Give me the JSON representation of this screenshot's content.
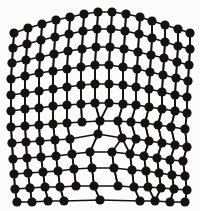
{
  "figure": {
    "name": "edge-dislocation-lattice",
    "title": "Edge dislocation in a crystal lattice",
    "background_color": "#fcfcfb",
    "atom_color": "#151210",
    "bond_color": "#141210",
    "atom_radius": 4.6,
    "bond_width": 1.7,
    "width": 200,
    "height": 211
  },
  "chart_data": {
    "type": "scatter",
    "title": "Edge dislocation in a crystal lattice",
    "xlabel": "",
    "ylabel": "",
    "grid": false,
    "legend": null,
    "xlim": [
      0,
      200
    ],
    "ylim": [
      0,
      211
    ],
    "annotations": [
      "extra half-plane terminating at dislocation core",
      "lattice rows curve around core",
      "bottom row shows gap where planes merge"
    ],
    "rows": [
      {
        "row": 0,
        "atoms": [
          [
            14,
            33
          ],
          [
            28,
            28
          ],
          [
            42,
            24
          ],
          [
            56,
            20
          ],
          [
            70,
            17
          ],
          [
            84,
            14
          ],
          [
            98,
            12
          ],
          [
            112,
            12
          ],
          [
            126,
            14
          ],
          [
            140,
            17
          ],
          [
            152,
            21
          ],
          [
            165,
            25
          ],
          [
            178,
            29
          ],
          [
            190,
            33
          ]
        ]
      },
      {
        "row": 1,
        "atoms": [
          [
            13,
            48
          ],
          [
            27,
            44
          ],
          [
            41,
            40
          ],
          [
            55,
            37
          ],
          [
            69,
            34
          ],
          [
            83,
            31
          ],
          [
            97,
            29
          ],
          [
            111,
            29
          ],
          [
            125,
            31
          ],
          [
            139,
            34
          ],
          [
            152,
            38
          ],
          [
            165,
            42
          ],
          [
            178,
            46
          ],
          [
            190,
            49
          ]
        ]
      },
      {
        "row": 2,
        "atoms": [
          [
            12,
            63
          ],
          [
            26,
            60
          ],
          [
            40,
            57
          ],
          [
            54,
            54
          ],
          [
            68,
            51
          ],
          [
            82,
            49
          ],
          [
            96,
            47
          ],
          [
            110,
            47
          ],
          [
            124,
            49
          ],
          [
            138,
            52
          ],
          [
            151,
            55
          ],
          [
            164,
            58
          ],
          [
            177,
            62
          ],
          [
            189,
            65
          ]
        ]
      },
      {
        "row": 3,
        "atoms": [
          [
            11,
            79
          ],
          [
            25,
            76
          ],
          [
            39,
            73
          ],
          [
            53,
            71
          ],
          [
            67,
            69
          ],
          [
            81,
            67
          ],
          [
            95,
            65
          ],
          [
            109,
            65
          ],
          [
            123,
            67
          ],
          [
            137,
            69
          ],
          [
            150,
            72
          ],
          [
            163,
            75
          ],
          [
            176,
            78
          ],
          [
            188,
            81
          ]
        ]
      },
      {
        "row": 4,
        "atoms": [
          [
            11,
            95
          ],
          [
            25,
            93
          ],
          [
            39,
            91
          ],
          [
            53,
            89
          ],
          [
            67,
            87
          ],
          [
            81,
            85
          ],
          [
            95,
            84
          ],
          [
            109,
            84
          ],
          [
            123,
            85
          ],
          [
            136,
            87
          ],
          [
            149,
            89
          ],
          [
            162,
            92
          ],
          [
            175,
            95
          ],
          [
            187,
            97
          ]
        ]
      },
      {
        "row": 5,
        "atoms": [
          [
            11,
            111
          ],
          [
            25,
            109
          ],
          [
            39,
            108
          ],
          [
            53,
            106
          ],
          [
            67,
            105
          ],
          [
            81,
            104
          ],
          [
            95,
            103
          ],
          [
            109,
            103
          ],
          [
            123,
            104
          ],
          [
            136,
            105
          ],
          [
            149,
            107
          ],
          [
            162,
            109
          ],
          [
            175,
            111
          ],
          [
            187,
            113
          ]
        ]
      },
      {
        "row": 6,
        "atoms": [
          [
            11,
            127
          ],
          [
            25,
            126
          ],
          [
            39,
            125
          ],
          [
            53,
            124
          ],
          [
            67,
            123
          ],
          [
            82,
            122
          ],
          [
            100,
            121
          ],
          [
            118,
            121
          ],
          [
            131,
            122
          ],
          [
            145,
            123
          ],
          [
            158,
            125
          ],
          [
            171,
            127
          ],
          [
            185,
            129
          ]
        ]
      },
      {
        "row": 7,
        "atoms": [
          [
            12,
            143
          ],
          [
            26,
            142
          ],
          [
            40,
            141
          ],
          [
            55,
            140
          ],
          [
            70,
            139
          ],
          [
            98,
            134
          ],
          [
            122,
            138
          ],
          [
            136,
            139
          ],
          [
            149,
            141
          ],
          [
            162,
            143
          ],
          [
            175,
            145
          ],
          [
            187,
            147
          ]
        ]
      },
      {
        "row": 8,
        "atoms": [
          [
            13,
            159
          ],
          [
            27,
            158
          ],
          [
            41,
            157
          ],
          [
            56,
            156
          ],
          [
            72,
            154
          ],
          [
            90,
            152
          ],
          [
            112,
            152
          ],
          [
            130,
            154
          ],
          [
            144,
            156
          ],
          [
            157,
            158
          ],
          [
            170,
            160
          ],
          [
            183,
            161
          ]
        ]
      },
      {
        "row": 9,
        "atoms": [
          [
            14,
            174
          ],
          [
            28,
            173
          ],
          [
            43,
            172
          ],
          [
            58,
            171
          ],
          [
            74,
            169
          ],
          [
            92,
            168
          ],
          [
            114,
            168
          ],
          [
            132,
            170
          ],
          [
            146,
            171
          ],
          [
            159,
            173
          ],
          [
            172,
            175
          ],
          [
            185,
            176
          ]
        ]
      },
      {
        "row": 10,
        "atoms": [
          [
            15,
            189
          ],
          [
            30,
            188
          ],
          [
            45,
            187
          ],
          [
            60,
            187
          ],
          [
            76,
            186
          ],
          [
            94,
            186
          ],
          [
            118,
            186
          ],
          [
            134,
            187
          ],
          [
            148,
            187
          ],
          [
            161,
            188
          ],
          [
            174,
            189
          ],
          [
            187,
            190
          ]
        ]
      },
      {
        "row": 11,
        "atoms": [
          [
            17,
            202
          ],
          [
            32,
            202
          ],
          [
            48,
            201
          ],
          [
            64,
            201
          ],
          [
            100,
            200
          ],
          [
            140,
            201
          ],
          [
            155,
            201
          ],
          [
            170,
            202
          ],
          [
            185,
            202
          ]
        ]
      }
    ],
    "dislocation_core": {
      "x": 98,
      "y": 134,
      "label": "dislocation core"
    }
  }
}
